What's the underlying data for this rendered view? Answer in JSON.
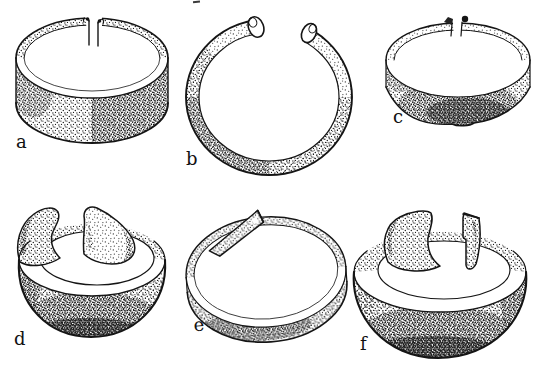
{
  "page": {
    "background_color": "#ffffff",
    "ink_color": "#151515",
    "figure_count": "6"
  },
  "plate": {
    "figures": [
      {
        "label": "a",
        "alt": "penannular band bracelet, oblique view, narrow gap with curled ends at top"
      },
      {
        "label": "b",
        "alt": "thin penannular bracelet with rolled knob terminals, frontal view"
      },
      {
        "label": "c",
        "alt": "small penannular band bracelet with knob terminals, slightly wavy band"
      },
      {
        "label": "d",
        "alt": "wide bowl-shaped bracelet with flared wing terminals"
      },
      {
        "label": "e",
        "alt": "narrow band bracelet with overlapping squared ends"
      },
      {
        "label": "f",
        "alt": "large bowl-shaped bracelet with tall upright flared terminals"
      }
    ]
  }
}
